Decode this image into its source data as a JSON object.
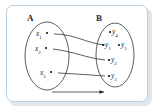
{
  "figure": {
    "frame_color": "#b9cfe0",
    "ink_color": "#1a1a1a",
    "background": "#ffffff"
  },
  "sets": [
    {
      "id": "A",
      "label": "A",
      "side": "left",
      "elements": [
        {
          "id": "x1",
          "base": "x",
          "subscript": "1"
        },
        {
          "id": "x2",
          "base": "x",
          "subscript": "2"
        },
        {
          "id": "x3",
          "base": "x",
          "subscript": "3"
        }
      ]
    },
    {
      "id": "B",
      "label": "B",
      "side": "right",
      "elements": [
        {
          "id": "y4",
          "base": "y",
          "subscript": "4"
        },
        {
          "id": "y1",
          "base": "y",
          "subscript": "1"
        },
        {
          "id": "y5",
          "base": "y",
          "subscript": "5"
        },
        {
          "id": "y2",
          "base": "y",
          "subscript": "2"
        },
        {
          "id": "y3",
          "base": "y",
          "subscript": "3"
        }
      ]
    }
  ],
  "mappings": [
    {
      "from": "x1",
      "to": "y1"
    },
    {
      "from": "x2",
      "to": "y2"
    },
    {
      "from": "x3",
      "to": "y3"
    }
  ],
  "bottom_arrow": {
    "name": "direction-arrow",
    "label": ""
  }
}
